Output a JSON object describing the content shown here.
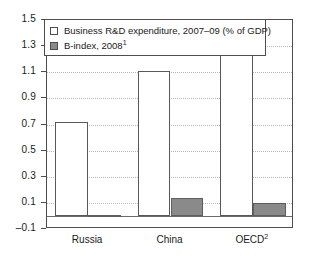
{
  "chart_data": {
    "type": "bar",
    "title": "",
    "subtitle": "",
    "xlabel": "",
    "ylabel": "",
    "categories": [
      "Russia",
      "China",
      "OECD"
    ],
    "category_footnotes": [
      "",
      "",
      "2"
    ],
    "series": [
      {
        "name": "Business R&D expenditure, 2007–09 (% of GDP)",
        "swatch": "white",
        "values": [
          0.72,
          1.11,
          1.25
        ]
      },
      {
        "name": "B-index, 2008",
        "footnote": "1",
        "swatch": "gray",
        "values": [
          0.01,
          0.14,
          0.1
        ]
      }
    ],
    "ylim": [
      -0.1,
      1.5
    ],
    "yticks": [
      "1.5",
      "1.3",
      "1.1",
      "0.9",
      "0.7",
      "0.5",
      "0.3",
      "0.1",
      "-0.1"
    ],
    "ytick_values": [
      1.5,
      1.3,
      1.1,
      0.9,
      0.7,
      0.5,
      0.3,
      0.1,
      -0.1
    ],
    "grid": "horizontal-dotted",
    "legend_position": "top-left",
    "colors": {
      "series_1_fill": "#ffffff",
      "series_2_fill": "#8a8a8a",
      "bar_edge": "#595959",
      "frame": "#4d4d4d",
      "gridline": "#b9b9b9",
      "zero_line": "#6b6b6b",
      "text": "#1a1a1a",
      "background": "#ffffff"
    }
  },
  "legend": {
    "items": [
      {
        "label": "Business R&D expenditure, 2007–09 (% of GDP)",
        "footnote": ""
      },
      {
        "label": "B-index, 2008",
        "footnote": "1"
      }
    ]
  }
}
